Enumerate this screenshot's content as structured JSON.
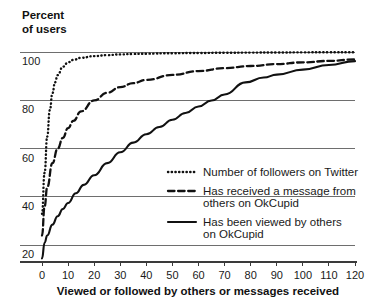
{
  "chart_data": {
    "type": "line",
    "title": "",
    "ylabel": "Percent of users",
    "ylabel_line1": "Percent",
    "ylabel_line2": "of users",
    "xlabel": "Viewed or followed by others or messages received",
    "xlim": [
      0,
      120
    ],
    "ylim": [
      13,
      103
    ],
    "xticks": [
      0,
      10,
      20,
      30,
      40,
      50,
      60,
      70,
      80,
      90,
      100,
      110,
      120
    ],
    "xtick_labels": [
      "0",
      "10",
      "20",
      "30",
      "40",
      "50",
      "60",
      "70",
      "80",
      "90",
      "100",
      "110",
      "120"
    ],
    "yticks": [
      20,
      40,
      60,
      80,
      100
    ],
    "ytick_labels": [
      "20",
      "40",
      "60",
      "80",
      "100"
    ],
    "grid": true,
    "grid_axis": "y",
    "legend_position": "inside-right-lower",
    "series": [
      {
        "name": "Number of followers on Twitter",
        "style": "dotted",
        "color": "#111111",
        "x": [
          0,
          1,
          2,
          3,
          4,
          5,
          6,
          8,
          10,
          12,
          15,
          20,
          25,
          30,
          35,
          40,
          50,
          60,
          70,
          80,
          90,
          100,
          110,
          120
        ],
        "y": [
          33,
          50,
          65,
          76,
          83,
          87.5,
          90.5,
          94,
          95.8,
          96.8,
          97.7,
          98.4,
          98.8,
          99.1,
          99.3,
          99.4,
          99.6,
          99.7,
          99.8,
          99.85,
          99.9,
          99.95,
          100,
          100
        ]
      },
      {
        "name": "Has received a message from others on OkCupid",
        "style": "dashed",
        "color": "#111111",
        "x": [
          0,
          1,
          2,
          4,
          6,
          8,
          10,
          12,
          15,
          20,
          25,
          30,
          35,
          40,
          50,
          60,
          70,
          80,
          90,
          100,
          110,
          120
        ],
        "y": [
          24,
          36,
          44,
          54,
          60,
          64.5,
          68.5,
          71.5,
          75.5,
          80,
          83.2,
          85.5,
          87.2,
          88.5,
          90.6,
          92.2,
          93.4,
          94.3,
          95.1,
          95.8,
          96.4,
          97
        ]
      },
      {
        "name": "Has been viewed by others on OkCupid",
        "style": "solid",
        "color": "#111111",
        "x": [
          0,
          1,
          2,
          4,
          6,
          8,
          10,
          13,
          16,
          20,
          25,
          30,
          35,
          40,
          45,
          50,
          55,
          60,
          65,
          70,
          78,
          85,
          90,
          100,
          110,
          120
        ],
        "y": [
          14.5,
          21,
          24,
          28.5,
          32,
          35,
          37.5,
          41.5,
          45,
          49,
          54,
          58.5,
          62.5,
          66,
          69,
          72,
          74.8,
          77.5,
          80,
          82.5,
          87.5,
          89.5,
          90.7,
          92.8,
          94.7,
          96.3
        ]
      }
    ],
    "legend_entries": [
      {
        "label_lines": [
          "Number of followers on Twitter"
        ],
        "style": "dotted"
      },
      {
        "label_lines": [
          "Has received a message from",
          "others on OkCupid"
        ],
        "style": "dashed"
      },
      {
        "label_lines": [
          "Has been viewed by others",
          "on OkCupid"
        ],
        "style": "solid"
      }
    ]
  }
}
